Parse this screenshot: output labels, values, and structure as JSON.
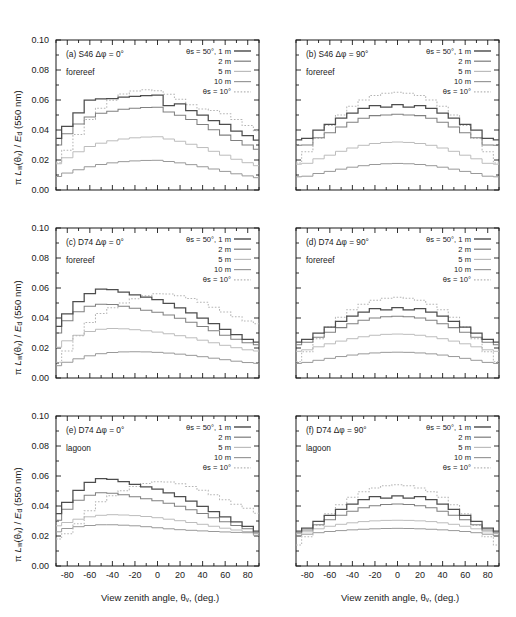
{
  "figure": {
    "axis_labels": {
      "x": "View zenith angle, θv, (deg.)",
      "y": "π Lw(θv) / Ed (550 nm)"
    },
    "x_ticks": [
      "-80",
      "-60",
      "-40",
      "-20",
      "0",
      "20",
      "40",
      "60",
      "80"
    ],
    "y_ticks": [
      "0.00",
      "0.02",
      "0.04",
      "0.06",
      "0.08",
      "0.10"
    ],
    "legend": {
      "entries": [
        "θs = 50°, 1 m",
        "2 m",
        "5 m",
        "10 m",
        "θs = 10°"
      ]
    },
    "colors": {
      "depth_1m": "#4d4d4d",
      "depth_2m": "#808080",
      "depth_5m": "#bcbcbc",
      "depth_10m": "#999999",
      "theta10": "#b5b5b5",
      "axis": "#1a1a1a"
    }
  },
  "chart_data": [
    {
      "type": "line",
      "panel": "a",
      "label": "(a) S46 Δφ = 0°",
      "sublabel": "forereef",
      "title": "(a) S46 Δφ = 0° forereef",
      "xlabel": "View zenith angle, θv, (deg.)",
      "ylabel": "π Lw(θv) / Ed (550 nm)",
      "xlim": [
        -90,
        90
      ],
      "ylim": [
        0.0,
        0.1
      ],
      "grid": false,
      "legend_position": "top-right",
      "x": [
        -90,
        -80,
        -70,
        -60,
        -50,
        -40,
        -30,
        -20,
        -10,
        0,
        10,
        20,
        30,
        40,
        50,
        60,
        70,
        80,
        90
      ],
      "series": [
        {
          "name": "θs = 50°, 1 m",
          "values": [
            0.0345,
            0.0425,
            0.0515,
            0.06,
            0.0607,
            0.061,
            0.0619,
            0.0624,
            0.063,
            0.0633,
            0.0562,
            0.0575,
            0.053,
            0.05,
            0.0462,
            0.0438,
            0.0392,
            0.0363,
            0.0333
          ]
        },
        {
          "name": "2 m",
          "values": [
            0.03,
            0.0375,
            0.044,
            0.0487,
            0.0512,
            0.0525,
            0.0538,
            0.0545,
            0.055,
            0.0552,
            0.052,
            0.0498,
            0.047,
            0.0437,
            0.0402,
            0.0366,
            0.033,
            0.03,
            0.0272
          ]
        },
        {
          "name": "5 m",
          "values": [
            0.0175,
            0.0215,
            0.0255,
            0.029,
            0.0312,
            0.0328,
            0.034,
            0.0348,
            0.0353,
            0.0355,
            0.034,
            0.0325,
            0.0305,
            0.0283,
            0.0258,
            0.0232,
            0.0205,
            0.0182,
            0.0162
          ]
        },
        {
          "name": "10 m",
          "values": [
            0.009,
            0.0113,
            0.0135,
            0.0155,
            0.017,
            0.0181,
            0.0189,
            0.0194,
            0.0197,
            0.0198,
            0.019,
            0.0181,
            0.0169,
            0.0155,
            0.014,
            0.0124,
            0.0108,
            0.0094,
            0.0082
          ]
        },
        {
          "name": "θs = 10°",
          "values": [
            0.0182,
            0.0265,
            0.037,
            0.047,
            0.0545,
            0.0598,
            0.064,
            0.066,
            0.0668,
            0.0662,
            0.0638,
            0.0605,
            0.0568,
            0.054,
            0.053,
            0.0508,
            0.047,
            0.043,
            0.0396
          ]
        }
      ]
    },
    {
      "type": "line",
      "panel": "b",
      "label": "(b) S46 Δφ = 90°",
      "sublabel": "forereef",
      "title": "(b) S46 Δφ = 90° forereef",
      "xlim": [
        -90,
        90
      ],
      "ylim": [
        0.0,
        0.1
      ],
      "grid": false,
      "legend_position": "top-right",
      "x": [
        -90,
        -80,
        -70,
        -60,
        -50,
        -40,
        -30,
        -20,
        -10,
        0,
        10,
        20,
        30,
        40,
        50,
        60,
        70,
        80,
        90
      ],
      "series": [
        {
          "name": "θs = 50°, 1 m",
          "values": [
            0.0335,
            0.0345,
            0.04,
            0.0438,
            0.048,
            0.0512,
            0.0545,
            0.0562,
            0.0552,
            0.057,
            0.0552,
            0.0562,
            0.0545,
            0.0512,
            0.048,
            0.0438,
            0.04,
            0.0345,
            0.0335
          ]
        },
        {
          "name": "2 m",
          "values": [
            0.0298,
            0.03,
            0.0348,
            0.0382,
            0.042,
            0.0452,
            0.0478,
            0.0496,
            0.05,
            0.0505,
            0.05,
            0.0496,
            0.0478,
            0.0452,
            0.042,
            0.0382,
            0.0348,
            0.03,
            0.0298
          ]
        },
        {
          "name": "5 m",
          "values": [
            0.0172,
            0.0178,
            0.0208,
            0.0232,
            0.0258,
            0.028,
            0.0298,
            0.031,
            0.0317,
            0.032,
            0.0317,
            0.031,
            0.0298,
            0.028,
            0.0258,
            0.0232,
            0.0208,
            0.0178,
            0.0172
          ]
        },
        {
          "name": "10 m",
          "values": [
            0.0088,
            0.0092,
            0.011,
            0.0124,
            0.0139,
            0.0152,
            0.0162,
            0.017,
            0.0175,
            0.0177,
            0.0175,
            0.017,
            0.0162,
            0.0152,
            0.0139,
            0.0124,
            0.011,
            0.0092,
            0.0088
          ]
        },
        {
          "name": "θs = 10°",
          "values": [
            0.018,
            0.0255,
            0.0345,
            0.043,
            0.05,
            0.0558,
            0.06,
            0.063,
            0.0645,
            0.0652,
            0.0645,
            0.063,
            0.06,
            0.0558,
            0.05,
            0.043,
            0.0345,
            0.0255,
            0.018
          ]
        }
      ]
    },
    {
      "type": "line",
      "panel": "c",
      "label": "(c) D74 Δφ = 0°",
      "sublabel": "forereef",
      "title": "(c) D74 Δφ = 0° forereef",
      "xlim": [
        -90,
        90
      ],
      "ylim": [
        0.0,
        0.1
      ],
      "grid": false,
      "legend_position": "top-right",
      "x": [
        -90,
        -80,
        -70,
        -60,
        -50,
        -40,
        -30,
        -20,
        -10,
        0,
        10,
        20,
        30,
        40,
        50,
        60,
        70,
        80,
        90
      ],
      "series": [
        {
          "name": "θs = 50°, 1 m",
          "values": [
            0.0345,
            0.0428,
            0.051,
            0.0562,
            0.0592,
            0.059,
            0.0572,
            0.0555,
            0.054,
            0.0522,
            0.0497,
            0.0468,
            0.0435,
            0.04,
            0.0362,
            0.0325,
            0.029,
            0.0258,
            0.024
          ]
        },
        {
          "name": "2 m",
          "values": [
            0.03,
            0.0382,
            0.0442,
            0.0478,
            0.0492,
            0.049,
            0.0478,
            0.0465,
            0.0452,
            0.0438,
            0.042,
            0.0398,
            0.0372,
            0.0344,
            0.0315,
            0.0285,
            0.0258,
            0.0235,
            0.0222
          ]
        },
        {
          "name": "5 m",
          "values": [
            0.0205,
            0.0248,
            0.0285,
            0.031,
            0.0325,
            0.033,
            0.0328,
            0.0322,
            0.0315,
            0.0306,
            0.0295,
            0.0282,
            0.0268,
            0.0252,
            0.0235,
            0.0218,
            0.0202,
            0.0188,
            0.018
          ]
        },
        {
          "name": "10 m",
          "values": [
            0.0082,
            0.0105,
            0.0128,
            0.0148,
            0.0162,
            0.017,
            0.0174,
            0.0175,
            0.0174,
            0.0171,
            0.0166,
            0.0159,
            0.0151,
            0.0142,
            0.0132,
            0.0122,
            0.0112,
            0.0103,
            0.0098
          ]
        },
        {
          "name": "θs = 10°",
          "values": [
            0.0105,
            0.018,
            0.0282,
            0.037,
            0.043,
            0.0468,
            0.05,
            0.0528,
            0.0548,
            0.0562,
            0.056,
            0.0548,
            0.053,
            0.0505,
            0.0472,
            0.044,
            0.0408,
            0.038,
            0.0362
          ]
        }
      ]
    },
    {
      "type": "line",
      "panel": "d",
      "label": "(d) D74 Δφ = 90°",
      "sublabel": "forereef",
      "title": "(d) D74 Δφ = 90° forereef",
      "xlim": [
        -90,
        90
      ],
      "ylim": [
        0.0,
        0.1
      ],
      "grid": false,
      "legend_position": "top-right",
      "x": [
        -90,
        -80,
        -70,
        -60,
        -50,
        -40,
        -30,
        -20,
        -10,
        0,
        10,
        20,
        30,
        40,
        50,
        60,
        70,
        80,
        90
      ],
      "series": [
        {
          "name": "θs = 50°, 1 m",
          "values": [
            0.024,
            0.0258,
            0.03,
            0.034,
            0.0378,
            0.0412,
            0.044,
            0.0462,
            0.0455,
            0.047,
            0.0455,
            0.0462,
            0.044,
            0.0412,
            0.0378,
            0.034,
            0.03,
            0.0258,
            0.024
          ]
        },
        {
          "name": "2 m",
          "values": [
            0.0222,
            0.0238,
            0.0272,
            0.0305,
            0.0336,
            0.0362,
            0.0385,
            0.04,
            0.0408,
            0.0412,
            0.0408,
            0.04,
            0.0385,
            0.0362,
            0.0336,
            0.0305,
            0.0272,
            0.0238,
            0.0222
          ]
        },
        {
          "name": "5 m",
          "values": [
            0.0178,
            0.0188,
            0.0208,
            0.0228,
            0.0246,
            0.0262,
            0.0275,
            0.0285,
            0.0291,
            0.0293,
            0.0291,
            0.0285,
            0.0275,
            0.0262,
            0.0246,
            0.0228,
            0.0208,
            0.0188,
            0.0178
          ]
        },
        {
          "name": "10 m",
          "values": [
            0.0097,
            0.0104,
            0.0118,
            0.0131,
            0.0143,
            0.0153,
            0.0161,
            0.0167,
            0.0171,
            0.0172,
            0.0171,
            0.0167,
            0.0161,
            0.0153,
            0.0143,
            0.0131,
            0.0118,
            0.0104,
            0.0097
          ]
        },
        {
          "name": "θs = 10°",
          "values": [
            0.0108,
            0.0175,
            0.0262,
            0.034,
            0.0405,
            0.0455,
            0.0492,
            0.0518,
            0.0532,
            0.0538,
            0.0532,
            0.0518,
            0.0492,
            0.0455,
            0.0405,
            0.034,
            0.0262,
            0.0175,
            0.0108
          ]
        }
      ]
    },
    {
      "type": "line",
      "panel": "e",
      "label": "(e) D74 Δφ = 0°",
      "sublabel": "lagoon",
      "title": "(e) D74 Δφ = 0° lagoon",
      "xlim": [
        -90,
        90
      ],
      "ylim": [
        0.0,
        0.1
      ],
      "grid": false,
      "legend_position": "top-right",
      "x": [
        -90,
        -80,
        -70,
        -60,
        -50,
        -40,
        -30,
        -20,
        -10,
        0,
        10,
        20,
        30,
        40,
        50,
        60,
        70,
        80,
        90
      ],
      "series": [
        {
          "name": "θs = 50°, 1 m",
          "values": [
            0.035,
            0.0425,
            0.0505,
            0.0558,
            0.0582,
            0.0578,
            0.0562,
            0.0545,
            0.0528,
            0.0512,
            0.0488,
            0.0462,
            0.0432,
            0.0398,
            0.0362,
            0.0328,
            0.0295,
            0.0265,
            0.0232
          ]
        },
        {
          "name": "2 m",
          "values": [
            0.0305,
            0.0378,
            0.0438,
            0.0472,
            0.0488,
            0.0485,
            0.0475,
            0.0462,
            0.0448,
            0.0435,
            0.0418,
            0.0398,
            0.0375,
            0.035,
            0.0322,
            0.0295,
            0.027,
            0.0248,
            0.0222
          ]
        },
        {
          "name": "5 m",
          "values": [
            0.0268,
            0.029,
            0.0312,
            0.0328,
            0.0338,
            0.0342,
            0.034,
            0.0336,
            0.033,
            0.0322,
            0.0312,
            0.0302,
            0.029,
            0.0278,
            0.0265,
            0.0252,
            0.024,
            0.023,
            0.0218
          ]
        },
        {
          "name": "10 m",
          "values": [
            0.0228,
            0.025,
            0.0262,
            0.027,
            0.0275,
            0.0275,
            0.0272,
            0.0268,
            0.0262,
            0.0255,
            0.0248,
            0.0242,
            0.0238,
            0.0234,
            0.023,
            0.0227,
            0.0224,
            0.0222,
            0.0205
          ]
        },
        {
          "name": "θs = 10°",
          "values": [
            0.018,
            0.0215,
            0.0282,
            0.0368,
            0.0428,
            0.0468,
            0.0502,
            0.053,
            0.055,
            0.0562,
            0.056,
            0.0548,
            0.053,
            0.0505,
            0.0475,
            0.0442,
            0.0412,
            0.0385,
            0.0352
          ]
        }
      ]
    },
    {
      "type": "line",
      "panel": "f",
      "label": "(f) D74 Δφ = 90°",
      "sublabel": "lagoon",
      "title": "(f) D74 Δφ = 90° lagoon",
      "xlim": [
        -90,
        90
      ],
      "ylim": [
        0.0,
        0.1
      ],
      "grid": false,
      "legend_position": "top-right",
      "x": [
        -90,
        -80,
        -70,
        -60,
        -50,
        -40,
        -30,
        -20,
        -10,
        0,
        10,
        20,
        30,
        40,
        50,
        60,
        70,
        80,
        90
      ],
      "series": [
        {
          "name": "θs = 50°, 1 m",
          "values": [
            0.0232,
            0.0252,
            0.0298,
            0.0338,
            0.0378,
            0.0412,
            0.0442,
            0.0462,
            0.0452,
            0.0468,
            0.0452,
            0.0462,
            0.0442,
            0.0412,
            0.0378,
            0.0338,
            0.0298,
            0.0252,
            0.0232
          ]
        },
        {
          "name": "2 m",
          "values": [
            0.0222,
            0.024,
            0.0275,
            0.0308,
            0.0338,
            0.0365,
            0.0388,
            0.0402,
            0.041,
            0.0414,
            0.041,
            0.0402,
            0.0388,
            0.0365,
            0.0338,
            0.0308,
            0.0275,
            0.024,
            0.0222
          ]
        },
        {
          "name": "5 m",
          "values": [
            0.0215,
            0.0228,
            0.0248,
            0.0265,
            0.0278,
            0.0288,
            0.0296,
            0.0301,
            0.0304,
            0.0305,
            0.0304,
            0.0301,
            0.0296,
            0.0288,
            0.0278,
            0.0265,
            0.0248,
            0.0228,
            0.0215
          ]
        },
        {
          "name": "10 m",
          "values": [
            0.02,
            0.0212,
            0.0222,
            0.023,
            0.0236,
            0.0241,
            0.0245,
            0.0248,
            0.025,
            0.0251,
            0.025,
            0.0248,
            0.0245,
            0.0241,
            0.0236,
            0.023,
            0.0222,
            0.0212,
            0.02
          ]
        },
        {
          "name": "θs = 10°",
          "values": [
            0.014,
            0.0195,
            0.0272,
            0.0348,
            0.0408,
            0.0458,
            0.0495,
            0.052,
            0.0535,
            0.0542,
            0.0535,
            0.052,
            0.0495,
            0.0458,
            0.0408,
            0.0348,
            0.0272,
            0.0195,
            0.014
          ]
        }
      ]
    }
  ]
}
